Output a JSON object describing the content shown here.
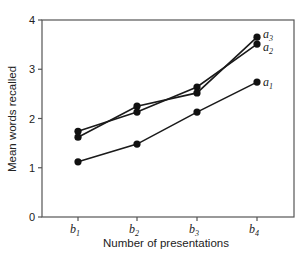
{
  "chart_data": {
    "type": "line",
    "title": "",
    "xlabel": "Number of presentations",
    "ylabel": "Mean words recalled",
    "categories": [
      "b1",
      "b2",
      "b3",
      "b4"
    ],
    "category_display": [
      {
        "main": "b",
        "sub": "1"
      },
      {
        "main": "b",
        "sub": "2"
      },
      {
        "main": "b",
        "sub": "3"
      },
      {
        "main": "b",
        "sub": "4"
      }
    ],
    "ylim": [
      0,
      4
    ],
    "yticks": [
      0,
      1,
      2,
      3,
      4
    ],
    "grid": false,
    "legend": "inline labels at right end of each line",
    "series": [
      {
        "name": "a1",
        "label_main": "a",
        "label_sub": "1",
        "values": [
          1.12,
          1.48,
          2.13,
          2.74
        ]
      },
      {
        "name": "a2",
        "label_main": "a",
        "label_sub": "2",
        "values": [
          1.74,
          2.13,
          2.64,
          3.51
        ]
      },
      {
        "name": "a3",
        "label_main": "a",
        "label_sub": "3",
        "values": [
          1.62,
          2.25,
          2.52,
          3.65
        ]
      }
    ]
  },
  "style": {
    "line_color": "#1a1a1a",
    "axis_color": "#555555",
    "marker_color": "#111111"
  }
}
